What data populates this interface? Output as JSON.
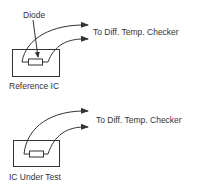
{
  "diagram": {
    "reference_section": {
      "diode_label": "Diode",
      "ic_label": "Reference IC",
      "output_label": "To Diff. Temp. Checker"
    },
    "test_section": {
      "ic_label": "IC Under Test",
      "output_label": "To Diff. Temp. Checker"
    },
    "colors": {
      "line": "#333333",
      "background": "#ffffff"
    }
  }
}
